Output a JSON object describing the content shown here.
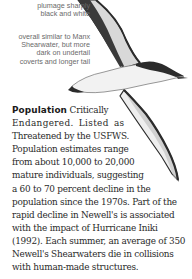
{
  "annotations": {
    "plumage": [
      "plumage sharply",
      "black and white"
    ],
    "overall": [
      "overall similar to Manx",
      "Shearwater, but more",
      "dark on undertail",
      "coverts and longer tail"
    ]
  },
  "illustration": {
    "subject": "Newell's Shearwater in flight",
    "colors": {
      "dark": "#2b2b2b",
      "mid": "#8a8a8a",
      "light": "#eeeeee"
    }
  },
  "population": {
    "heading": "Population",
    "lines": [
      "Critically",
      "Endangered. Listed as",
      "Threatened by the USFWS.",
      "Population estimates range",
      "from about 10,000 to 20,000",
      "mature individuals, suggesting",
      "a 60 to 70 percent decline in the",
      "population since the 1970s. Part of the",
      "rapid decline in Newell's is associated",
      "with the impact of Hurricane Iniki",
      "(1992). Each summer, an average of 350",
      "Newell's Shearwaters die in collisions",
      "with human-made structures."
    ]
  }
}
